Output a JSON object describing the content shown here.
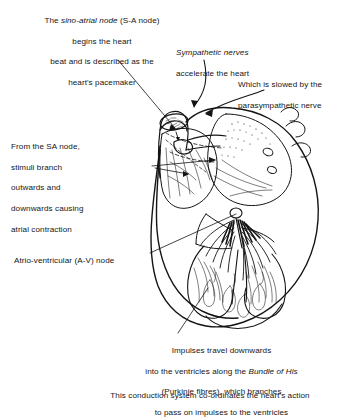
{
  "figure": {
    "ink_color": "#151515",
    "background_color": "#ffffff"
  },
  "labels": {
    "sa_node": {
      "line1_pre": "The ",
      "line1_italic": "sino-atrial node",
      "line1_post": " (S-A node)",
      "line2": "begins the heart",
      "line3": "beat and is described as the",
      "line4": "heart's pacemaker"
    },
    "sympathetic": {
      "line1_italic": "Sympathetic nerves",
      "line2": "accelerate the heart"
    },
    "parasympathetic": {
      "line1": "Which is slowed by the",
      "line2": "parasympathetic nerve"
    },
    "from_sa_node": {
      "line1": "From the SA node,",
      "line2": "stimuli branch",
      "line3": "outwards and",
      "line4": "downwards causing",
      "line5": "atrial contraction"
    },
    "av_node": {
      "text": "Atrio-ventricular (A-V) node"
    },
    "impulses": {
      "line1": "Impulses travel downwards",
      "line2_pre": "into the ventricles along the ",
      "line2_italic": "Bundle of His",
      "line3": "(Purkinje fibres), which branches",
      "line4": "to pass on impulses to the ventricles"
    },
    "footer": {
      "text": "This conduction system co-ordinates the heart's action"
    }
  },
  "leaders": {
    "sa_node_leader": "line from sa-node caption down-right to sinoatrial node on superior vena cava",
    "sympathetic_leader": "curved arrow from sympathetic caption to upper heart base",
    "parasympathetic_leader": "curved arrow from parasympathetic caption to heart base",
    "from_sa_leader": "horizontal arrow into right atrium wall",
    "av_node_leader": "line up-right to atrioventricular node",
    "impulses_leader": "line up from impulses caption to ventricular apex"
  }
}
